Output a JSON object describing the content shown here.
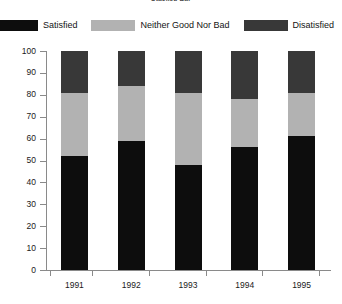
{
  "chart_data": {
    "type": "bar",
    "subtype": "stacked-bar-100",
    "title": "Stacked Bar",
    "xlabel": "",
    "ylabel": "",
    "ylim": [
      0,
      100
    ],
    "yticks": [
      0,
      10,
      20,
      30,
      40,
      50,
      60,
      70,
      80,
      90,
      100
    ],
    "grid": false,
    "legend_position": "top",
    "categories": [
      "1991",
      "1992",
      "1993",
      "1994",
      "1995"
    ],
    "series": [
      {
        "name": "Satisfied",
        "color": "#0d0d0d",
        "values": [
          52,
          59,
          48,
          56,
          61
        ]
      },
      {
        "name": "Neither Good Nor Bad",
        "color": "#b2b2b2",
        "values": [
          29,
          25,
          33,
          22,
          20
        ]
      },
      {
        "name": "Disatisfied",
        "color": "#383838",
        "values": [
          19,
          16,
          19,
          22,
          19
        ]
      }
    ],
    "segment_tops": [
      [
        52,
        81,
        100
      ],
      [
        59,
        84,
        100
      ],
      [
        48,
        81,
        100
      ],
      [
        56,
        78,
        100
      ],
      [
        61,
        81,
        100
      ]
    ]
  },
  "legend": {
    "items": [
      {
        "label": "Satisfied",
        "color": "#0d0d0d"
      },
      {
        "label": "Neither Good Nor Bad",
        "color": "#b2b2b2"
      },
      {
        "label": "Disatisfied",
        "color": "#383838"
      }
    ]
  },
  "axes": {
    "y_labels": [
      "100",
      "90",
      "80",
      "70",
      "60",
      "50",
      "40",
      "30",
      "20",
      "10",
      "0"
    ],
    "x_labels": [
      "1991",
      "1992",
      "1993",
      "1994",
      "1995"
    ]
  }
}
